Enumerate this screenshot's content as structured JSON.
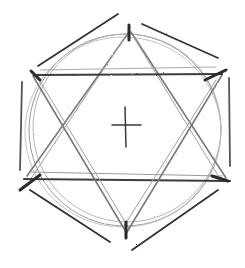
{
  "colors": {
    "background": "#ffffff",
    "stroke_dark": "#2a2a2a",
    "stroke_mid": "#555555",
    "stroke_light": "#9a9a9a"
  },
  "sketch": {
    "center": [
      125,
      127
    ],
    "circle": {
      "cx": 125,
      "cy": 130,
      "r": 96
    },
    "vertices": {
      "top": [
        129,
        30
      ],
      "upper_left": [
        33,
        75
      ],
      "upper_right": [
        222,
        73
      ],
      "lower_left": [
        25,
        178
      ],
      "lower_right": [
        228,
        180
      ],
      "bottom": [
        126,
        235
      ]
    },
    "cross": {
      "v": [
        [
          125,
          107
        ],
        [
          126,
          147
        ]
      ],
      "h": [
        [
          112,
          125
        ],
        [
          141,
          125
        ]
      ]
    }
  }
}
